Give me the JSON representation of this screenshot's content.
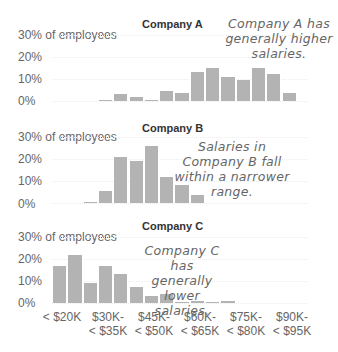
{
  "chart_data": [
    {
      "type": "bar",
      "title": "Company A",
      "ylabel": "% of employees",
      "yticks": [
        "0%",
        "10%",
        "20%",
        "30% of employees"
      ],
      "ylim": [
        0,
        30
      ],
      "annotation": "Company A has generally higher salaries.",
      "categories": [
        "< $20K",
        "$20K-< $25K",
        "$25K-< $30K",
        "$30K-< $35K",
        "$35K-< $40K",
        "$40K-< $45K",
        "$45K-< $50K",
        "$50K-< $55K",
        "$55K-< $60K",
        "$60K-< $65K",
        "$65K-< $70K",
        "$70K-< $75K",
        "$75K-< $80K",
        "$80K-< $85K",
        "$85K-< $90K",
        "$90K-< $95K"
      ],
      "values": [
        0,
        0,
        0,
        0.3,
        3,
        2,
        0.3,
        4.5,
        3.5,
        13,
        15,
        11,
        9.5,
        15,
        12.5,
        3.5
      ]
    },
    {
      "type": "bar",
      "title": "Company B",
      "ylabel": "% of employees",
      "yticks": [
        "0%",
        "10%",
        "20%",
        "30% of employees"
      ],
      "ylim": [
        0,
        30
      ],
      "annotation": "Salaries in Company B fall within a narrower range.",
      "categories": [
        "< $20K",
        "$20K-< $25K",
        "$25K-< $30K",
        "$30K-< $35K",
        "$35K-< $40K",
        "$40K-< $45K",
        "$45K-< $50K",
        "$50K-< $55K",
        "$55K-< $60K",
        "$60K-< $65K",
        "$65K-< $70K",
        "$70K-< $75K",
        "$75K-< $80K",
        "$80K-< $85K",
        "$85K-< $90K",
        "$90K-< $95K"
      ],
      "values": [
        0,
        0,
        0.3,
        5.5,
        21,
        19,
        26,
        12,
        8,
        3.5,
        0,
        0,
        0,
        0,
        0,
        0
      ]
    },
    {
      "type": "bar",
      "title": "Company C",
      "ylabel": "% of employees",
      "yticks": [
        "0%",
        "10%",
        "20%",
        "30% of employees"
      ],
      "ylim": [
        0,
        30
      ],
      "annotation": "Company C has generally lower salaries.",
      "categories": [
        "< $20K",
        "$20K-< $25K",
        "$25K-< $30K",
        "$30K-< $35K",
        "$35K-< $40K",
        "$40K-< $45K",
        "$45K-< $50K",
        "$50K-< $55K",
        "$55K-< $60K",
        "$60K-< $65K",
        "$65K-< $70K",
        "$70K-< $75K",
        "$75K-< $80K",
        "$80K-< $85K",
        "$85K-< $90K",
        "$90K-< $95K"
      ],
      "values": [
        17,
        22,
        9,
        17,
        13,
        7.5,
        3,
        4,
        0.3,
        1,
        0.3,
        1,
        0,
        0,
        0,
        0
      ]
    }
  ],
  "xaxis": {
    "labels": [
      {
        "line1": "< $20K",
        "line2": ""
      },
      {
        "line1": "$30K-",
        "line2": "< $35K"
      },
      {
        "line1": "$45K-",
        "line2": "< $50K"
      },
      {
        "line1": "$60K-",
        "line2": "< $65K"
      },
      {
        "line1": "$75K-",
        "line2": "< $80K"
      },
      {
        "line1": "$90K-",
        "line2": "< $95K"
      }
    ]
  },
  "panels": [
    {
      "title": "Company A",
      "note_lines": [
        "Company A has",
        "generally higher",
        "salaries."
      ]
    },
    {
      "title": "Company B",
      "note_lines": [
        "Salaries in",
        "Company B fall",
        "within a narrower",
        "range."
      ]
    },
    {
      "title": "Company C",
      "note_lines": [
        "Company C has",
        "generally lower",
        "salaries."
      ]
    }
  ],
  "yticks": {
    "t30": "30% of employees",
    "t20": "20%",
    "t10": "10%",
    "t0": "0%"
  }
}
